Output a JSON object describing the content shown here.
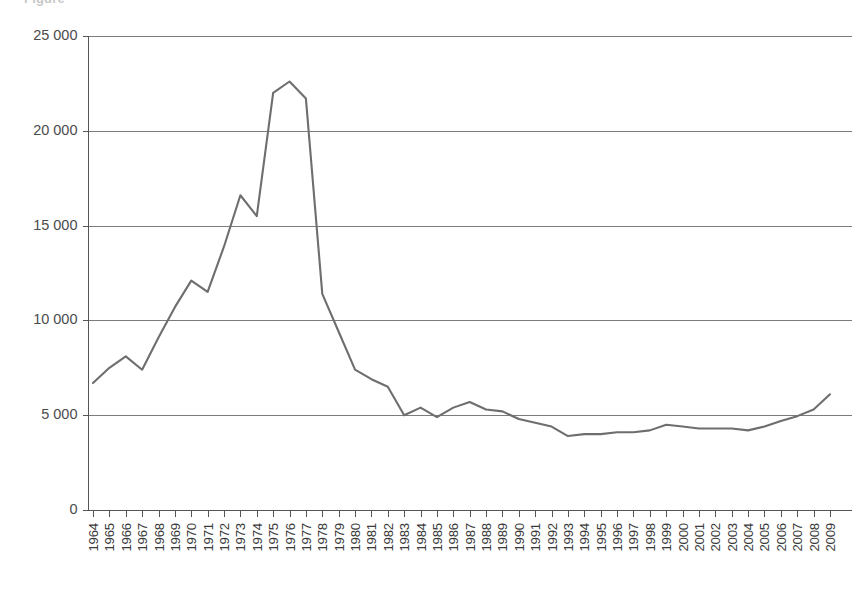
{
  "figure": {
    "cutoff_title": "Figure",
    "line_color": "#6e6e6e",
    "grid_color": "#7c7c7c",
    "axis_color": "#555555",
    "background": "#ffffff"
  },
  "chart_data": {
    "type": "line",
    "title": "",
    "xlabel": "",
    "ylabel": "",
    "grid": "horizontal",
    "legend": "none",
    "ylim": [
      0,
      25000
    ],
    "yticks": [
      0,
      5000,
      10000,
      15000,
      20000,
      25000
    ],
    "ytick_labels": [
      "0",
      "5 000",
      "10 000",
      "15 000",
      "20 000",
      "25 000"
    ],
    "xlim": [
      1964,
      2009
    ],
    "categories": [
      "1964",
      "1965",
      "1966",
      "1967",
      "1968",
      "1969",
      "1970",
      "1971",
      "1972",
      "1973",
      "1974",
      "1975",
      "1976",
      "1977",
      "1978",
      "1979",
      "1980",
      "1981",
      "1982",
      "1983",
      "1984",
      "1985",
      "1986",
      "1987",
      "1988",
      "1989",
      "1990",
      "1991",
      "1992",
      "1993",
      "1994",
      "1995",
      "1996",
      "1997",
      "1998",
      "1999",
      "2000",
      "2001",
      "2002",
      "2003",
      "2004",
      "2005",
      "2006",
      "2007",
      "2008",
      "2009"
    ],
    "series": [
      {
        "name": "series-1",
        "values": [
          6700,
          7500,
          8100,
          7400,
          9100,
          10700,
          12100,
          11500,
          13900,
          16600,
          15500,
          22000,
          22600,
          21700,
          11400,
          9400,
          7400,
          6900,
          6500,
          5000,
          5400,
          4900,
          5400,
          5700,
          5300,
          5200,
          4800,
          4600,
          4400,
          3900,
          4000,
          4000,
          4100,
          4100,
          4200,
          4500,
          4400,
          4300,
          4300,
          4300,
          4200,
          4400,
          4700,
          4950,
          5300,
          6100
        ]
      }
    ]
  }
}
